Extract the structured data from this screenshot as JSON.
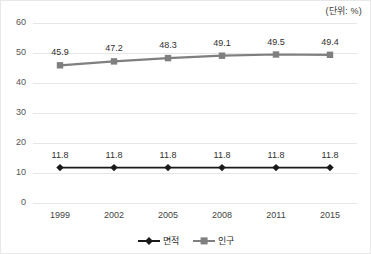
{
  "unit_note": "(단위: %)",
  "legend": {
    "position": "bottom-center",
    "entries": [
      {
        "label": "면적",
        "color": "#1a1a1a",
        "marker": "diamond-marker"
      },
      {
        "label": "인구",
        "color": "#7f7f7f",
        "marker": "square-marker"
      }
    ]
  },
  "chart_data": {
    "type": "line",
    "title": "",
    "subtitle": "",
    "xlabel": "",
    "ylabel": "",
    "unit": "(단위: %)",
    "categories": [
      "1999",
      "2002",
      "2005",
      "2008",
      "2011",
      "2015"
    ],
    "ylim": [
      0,
      60
    ],
    "yticks": [
      0,
      10,
      20,
      30,
      40,
      50,
      60
    ],
    "ytick_labels": [
      "0",
      "10",
      "20",
      "30",
      "40",
      "50",
      "60"
    ],
    "grid": true,
    "grid_axis": "y",
    "legend_position": "bottom-center",
    "series": [
      {
        "name": "면적",
        "color": "#1a1a1a",
        "marker": "diamond",
        "values": [
          11.8,
          11.8,
          11.8,
          11.8,
          11.8,
          11.8
        ],
        "labels": [
          "11.8",
          "11.8",
          "11.8",
          "11.8",
          "11.8",
          "11.8"
        ]
      },
      {
        "name": "인구",
        "color": "#7f7f7f",
        "marker": "square",
        "values": [
          45.9,
          47.2,
          48.3,
          49.1,
          49.5,
          49.4
        ],
        "labels": [
          "45.9",
          "47.2",
          "48.3",
          "49.1",
          "49.5",
          "49.4"
        ]
      }
    ]
  }
}
